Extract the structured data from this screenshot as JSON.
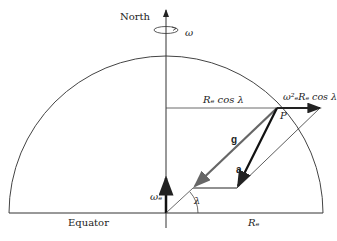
{
  "labels": {
    "north": "North",
    "omega": "ω",
    "rcos": "Rₑ cos λ",
    "centrip": "ω²ₑRₑ cos λ",
    "p": "P",
    "g": "g",
    "a": "a",
    "omega_e": "ωₑ",
    "lambda": "λ",
    "equator": "Equator",
    "re": "Rₑ"
  },
  "colors": {
    "line": "#333333",
    "g_vector": "#555555",
    "heavy": "#111111"
  }
}
